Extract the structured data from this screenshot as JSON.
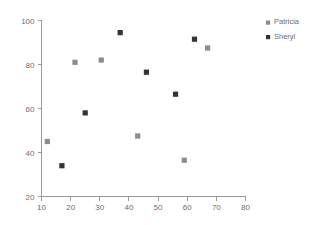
{
  "chart_data": {
    "type": "scatter",
    "title": "",
    "xlabel": "",
    "ylabel": "",
    "xlim": [
      10,
      80
    ],
    "ylim": [
      20,
      100
    ],
    "xticks": [
      10,
      20,
      30,
      40,
      50,
      60,
      70,
      80
    ],
    "yticks": [
      20,
      40,
      60,
      80,
      100
    ],
    "grid": false,
    "legend_position": "right",
    "series": [
      {
        "name": "Patricia",
        "color": "#8c8c8c",
        "marker": "square",
        "points": [
          {
            "x": 12,
            "y": 45
          },
          {
            "x": 21.5,
            "y": 81
          },
          {
            "x": 30.5,
            "y": 82
          },
          {
            "x": 43,
            "y": 47.5
          },
          {
            "x": 59,
            "y": 36.5
          },
          {
            "x": 67,
            "y": 87.5
          }
        ]
      },
      {
        "name": "Sheryl",
        "color": "#333333",
        "marker": "square",
        "points": [
          {
            "x": 17,
            "y": 34
          },
          {
            "x": 25,
            "y": 58
          },
          {
            "x": 37,
            "y": 94.5
          },
          {
            "x": 46,
            "y": 76.5
          },
          {
            "x": 56,
            "y": 66.5
          },
          {
            "x": 62.5,
            "y": 91.5
          }
        ]
      }
    ]
  },
  "legend": {
    "entries": [
      {
        "label": "Patricia",
        "color": "#8c8c8c"
      },
      {
        "label": "Sheryl",
        "color": "#333333"
      }
    ]
  },
  "axes": {
    "x_tick_labels": [
      "10",
      "20",
      "30",
      "40",
      "50",
      "60",
      "70",
      "80"
    ],
    "y_tick_labels": [
      "20",
      "40",
      "60",
      "80",
      "100"
    ],
    "axis_color": "#9a9a9a",
    "tick_label_color": "#6e6e6e"
  }
}
